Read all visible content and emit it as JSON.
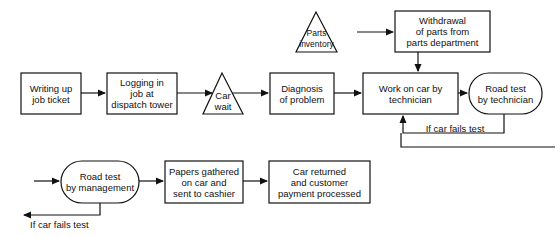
{
  "nodes": {
    "writing": "Writing up\njob ticket",
    "logging": "Logging in\njob at\ndispatch tower",
    "car_wait": "Car\nwait",
    "diagnosis": "Diagnosis\nof problem",
    "parts_inventory": "Parts\ninventory",
    "withdrawal": "Withdrawal\nof parts from\nparts department",
    "work": "Work on car by\ntechnician",
    "road_tech": "Road test\nby technician",
    "road_mgmt": "Road test\nby management",
    "papers": "Papers gathered\non car and\nsent to cashier",
    "returned": "Car returned\nand customer\npayment processed"
  },
  "labels": {
    "fail_tech": "If car fails test",
    "fail_mgmt": "If car fails test"
  }
}
